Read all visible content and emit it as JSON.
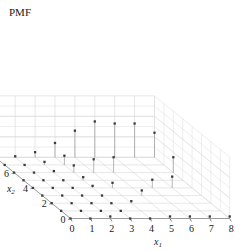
{
  "chart_data": {
    "type": "scatter",
    "title": "PMF",
    "xlabel": "x₁",
    "ylabel": "x₂",
    "zlabel": "PMF",
    "projection": "3d-stem",
    "grid": true,
    "legend": null,
    "xlim": [
      0,
      8
    ],
    "ylim": [
      0,
      8
    ],
    "zlim": [
      0,
      0.12
    ],
    "xticks": [
      0,
      1,
      2,
      3,
      4,
      5,
      6,
      7,
      8
    ],
    "yticks": [
      0,
      2,
      4,
      6,
      8
    ],
    "zticks": [
      0,
      0.04,
      0.08,
      0.12
    ],
    "ztick_labels": [
      "",
      "0.04",
      "0.08",
      "0.12"
    ],
    "xtick_labels": [
      "0",
      "1",
      "2",
      "3",
      "4",
      "5",
      "6",
      "7",
      "8"
    ],
    "ytick_labels": [
      "0",
      "2",
      "4",
      "6",
      "8"
    ],
    "points": [
      {
        "x1": 0,
        "x2": 0,
        "pmf": 0.0
      },
      {
        "x1": 0,
        "x2": 1,
        "pmf": 0.0
      },
      {
        "x1": 0,
        "x2": 2,
        "pmf": 0.0
      },
      {
        "x1": 0,
        "x2": 3,
        "pmf": 0.0
      },
      {
        "x1": 0,
        "x2": 4,
        "pmf": 0.0
      },
      {
        "x1": 0,
        "x2": 5,
        "pmf": 0.0
      },
      {
        "x1": 0,
        "x2": 6,
        "pmf": 0.0
      },
      {
        "x1": 0,
        "x2": 7,
        "pmf": 0.0
      },
      {
        "x1": 0,
        "x2": 8,
        "pmf": 0.0
      },
      {
        "x1": 1,
        "x2": 0,
        "pmf": 0.0
      },
      {
        "x1": 1,
        "x2": 1,
        "pmf": 0.0
      },
      {
        "x1": 1,
        "x2": 2,
        "pmf": 0.0
      },
      {
        "x1": 1,
        "x2": 3,
        "pmf": 0.0
      },
      {
        "x1": 1,
        "x2": 4,
        "pmf": 0.0
      },
      {
        "x1": 1,
        "x2": 5,
        "pmf": 0.0
      },
      {
        "x1": 1,
        "x2": 6,
        "pmf": 0.0
      },
      {
        "x1": 1,
        "x2": 7,
        "pmf": 0.0
      },
      {
        "x1": 1,
        "x2": 8,
        "pmf": 0.002
      },
      {
        "x1": 2,
        "x2": 0,
        "pmf": 0.004
      },
      {
        "x1": 2,
        "x2": 1,
        "pmf": 0.0
      },
      {
        "x1": 2,
        "x2": 2,
        "pmf": 0.0
      },
      {
        "x1": 2,
        "x2": 3,
        "pmf": 0.0
      },
      {
        "x1": 2,
        "x2": 4,
        "pmf": 0.0
      },
      {
        "x1": 2,
        "x2": 5,
        "pmf": 0.0
      },
      {
        "x1": 2,
        "x2": 6,
        "pmf": 0.003
      },
      {
        "x1": 2,
        "x2": 7,
        "pmf": 0.006
      },
      {
        "x1": 2,
        "x2": 8,
        "pmf": 0.01
      },
      {
        "x1": 3,
        "x2": 0,
        "pmf": 0.0
      },
      {
        "x1": 3,
        "x2": 1,
        "pmf": 0.0
      },
      {
        "x1": 3,
        "x2": 2,
        "pmf": 0.0
      },
      {
        "x1": 3,
        "x2": 3,
        "pmf": 0.0
      },
      {
        "x1": 3,
        "x2": 4,
        "pmf": 0.004
      },
      {
        "x1": 3,
        "x2": 5,
        "pmf": 0.006
      },
      {
        "x1": 3,
        "x2": 6,
        "pmf": 0.014
      },
      {
        "x1": 3,
        "x2": 7,
        "pmf": 0.018
      },
      {
        "x1": 3,
        "x2": 8,
        "pmf": 0.028
      },
      {
        "x1": 4,
        "x2": 0,
        "pmf": 0.0
      },
      {
        "x1": 4,
        "x2": 2,
        "pmf": 0.004
      },
      {
        "x1": 4,
        "x2": 4,
        "pmf": 0.01
      },
      {
        "x1": 4,
        "x2": 6,
        "pmf": 0.026
      },
      {
        "x1": 4,
        "x2": 8,
        "pmf": 0.052
      },
      {
        "x1": 5,
        "x2": 0,
        "pmf": 0.004
      },
      {
        "x1": 5,
        "x2": 3,
        "pmf": 0.01
      },
      {
        "x1": 5,
        "x2": 6,
        "pmf": 0.03
      },
      {
        "x1": 5,
        "x2": 8,
        "pmf": 0.07
      },
      {
        "x1": 6,
        "x2": 0,
        "pmf": 0.004
      },
      {
        "x1": 6,
        "x2": 4,
        "pmf": 0.016
      },
      {
        "x1": 6,
        "x2": 8,
        "pmf": 0.066
      },
      {
        "x1": 7,
        "x2": 0,
        "pmf": 0.004
      },
      {
        "x1": 7,
        "x2": 4,
        "pmf": 0.022
      },
      {
        "x1": 7,
        "x2": 8,
        "pmf": 0.066
      },
      {
        "x1": 8,
        "x2": 0,
        "pmf": 0.004
      },
      {
        "x1": 8,
        "x2": 6,
        "pmf": 0.03
      },
      {
        "x1": 8,
        "x2": 8,
        "pmf": 0.048
      }
    ],
    "colors": {
      "marker": "#3c3c3c",
      "stem": "#9a9a9a",
      "grid": "#cfcfcf",
      "axis": "#8a8a8a",
      "text": "#1a1a1a",
      "background": "#ffffff"
    }
  }
}
